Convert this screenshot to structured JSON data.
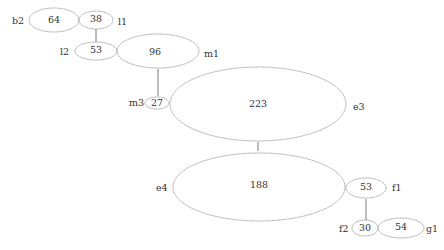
{
  "diagram": {
    "type": "graph",
    "colors": {
      "stroke": "#9a9a9a",
      "edge": "#7a7a7a",
      "text": "#333333",
      "background": "#ffffff"
    },
    "nodes": [
      {
        "id": "b2",
        "label": "b2",
        "value": "64"
      },
      {
        "id": "l1",
        "label": "l1",
        "value": "38"
      },
      {
        "id": "l2",
        "label": "l2",
        "value": "53"
      },
      {
        "id": "m1",
        "label": "m1",
        "value": "96"
      },
      {
        "id": "m3",
        "label": "m3",
        "value": "27"
      },
      {
        "id": "e3",
        "label": "e3",
        "value": "223"
      },
      {
        "id": "e4",
        "label": "e4",
        "value": "188"
      },
      {
        "id": "f1",
        "label": "f1",
        "value": "53"
      },
      {
        "id": "f2",
        "label": "f2",
        "value": "30"
      },
      {
        "id": "g1",
        "label": "g1",
        "value": "54"
      }
    ],
    "edges": [
      {
        "from": "l1",
        "to": "l2"
      },
      {
        "from": "m1",
        "to": "m3"
      },
      {
        "from": "e3",
        "to": "e4"
      },
      {
        "from": "f1",
        "to": "f2"
      }
    ]
  }
}
